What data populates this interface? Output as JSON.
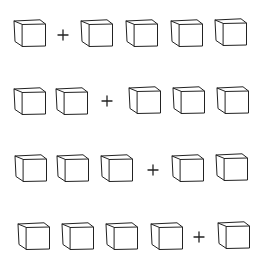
{
  "figure": {
    "stroke_color": "#222222",
    "background": "#ffffff",
    "rows": [
      {
        "items": [
          {
            "type": "cube",
            "x": 13,
            "y": 19
          },
          {
            "type": "plus",
            "x": 57,
            "y": 29
          },
          {
            "type": "cube",
            "x": 80,
            "y": 19
          },
          {
            "type": "cube",
            "x": 125,
            "y": 19
          },
          {
            "type": "cube",
            "x": 170,
            "y": 19
          },
          {
            "type": "cube",
            "x": 214,
            "y": 18
          }
        ]
      },
      {
        "items": [
          {
            "type": "cube",
            "x": 13,
            "y": 87
          },
          {
            "type": "cube",
            "x": 55,
            "y": 87
          },
          {
            "type": "plus",
            "x": 101,
            "y": 95
          },
          {
            "type": "cube",
            "x": 128,
            "y": 86
          },
          {
            "type": "cube",
            "x": 172,
            "y": 86
          },
          {
            "type": "cube",
            "x": 216,
            "y": 86
          }
        ]
      },
      {
        "items": [
          {
            "type": "cube",
            "x": 14,
            "y": 154
          },
          {
            "type": "cube",
            "x": 56,
            "y": 154
          },
          {
            "type": "cube",
            "x": 100,
            "y": 154
          },
          {
            "type": "plus",
            "x": 147,
            "y": 164
          },
          {
            "type": "cube",
            "x": 171,
            "y": 154
          },
          {
            "type": "cube",
            "x": 215,
            "y": 153
          }
        ]
      },
      {
        "items": [
          {
            "type": "cube",
            "x": 17,
            "y": 222
          },
          {
            "type": "cube",
            "x": 61,
            "y": 222
          },
          {
            "type": "cube",
            "x": 105,
            "y": 222
          },
          {
            "type": "cube",
            "x": 150,
            "y": 222
          },
          {
            "type": "plus",
            "x": 193,
            "y": 231
          },
          {
            "type": "cube",
            "x": 217,
            "y": 221
          }
        ]
      }
    ]
  }
}
